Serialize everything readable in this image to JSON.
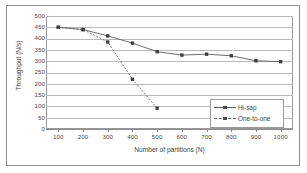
{
  "figure": {
    "frame_border_color": "#8e8e8e",
    "background": "#ffffff"
  },
  "chart_data": {
    "type": "line",
    "title": "",
    "xlabel": "Number of partitions (N)",
    "ylabel": "Throughput (N/s)",
    "x": [
      100,
      200,
      300,
      400,
      500,
      600,
      700,
      800,
      900,
      1000
    ],
    "xlim": [
      50,
      1050
    ],
    "ylim": [
      0,
      500
    ],
    "ytick_step": 50,
    "yticks": [
      0,
      50,
      100,
      150,
      200,
      250,
      300,
      350,
      400,
      450,
      500
    ],
    "ytick_labels": [
      "0",
      "50",
      "100",
      "150",
      "200",
      "250",
      "300",
      "350",
      "400",
      "450",
      "500"
    ],
    "xticks": [
      100,
      200,
      300,
      400,
      500,
      600,
      700,
      800,
      900,
      1000
    ],
    "xtick_labels": [
      "100",
      "200",
      "300",
      "400",
      "500",
      "600",
      "700",
      "800",
      "900",
      "1000"
    ],
    "grid": true,
    "grid_axis": "y",
    "legend_position": "lower-right",
    "series": [
      {
        "name": "Hi-sap",
        "style": "solid",
        "marker": "square",
        "color": "#5d5d5d",
        "x": [
          100,
          200,
          300,
          400,
          500,
          600,
          700,
          800,
          900,
          1000
        ],
        "values": [
          450,
          440,
          412,
          380,
          342,
          327,
          331,
          324,
          302,
          298
        ]
      },
      {
        "name": "One-to-one",
        "style": "dashed",
        "marker": "square",
        "color": "#6a6a6a",
        "x": [
          100,
          200,
          300,
          400,
          500
        ],
        "values": [
          450,
          440,
          385,
          220,
          92
        ]
      }
    ]
  },
  "legend": {
    "entries": [
      {
        "label": "Hi-sap",
        "style": "solid"
      },
      {
        "label": "One-to-one",
        "style": "dashed"
      }
    ]
  }
}
